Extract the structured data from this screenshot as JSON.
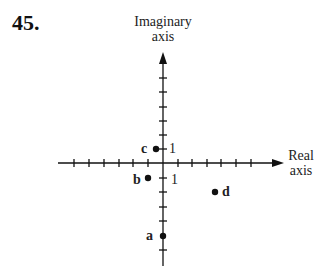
{
  "problem_number": "45.",
  "axes": {
    "imaginary_label_line1": "Imaginary",
    "imaginary_label_line2": "axis",
    "real_label_line1": "Real",
    "real_label_line2": "axis",
    "unit_label_imag": "1",
    "unit_label_real": "1"
  },
  "points": [
    {
      "label": "a",
      "re": 0,
      "im": -5
    },
    {
      "label": "b",
      "re": -1,
      "im": -1
    },
    {
      "label": "c",
      "re": -0.5,
      "im": 1
    },
    {
      "label": "d",
      "re": 3.5,
      "im": -2
    }
  ]
}
